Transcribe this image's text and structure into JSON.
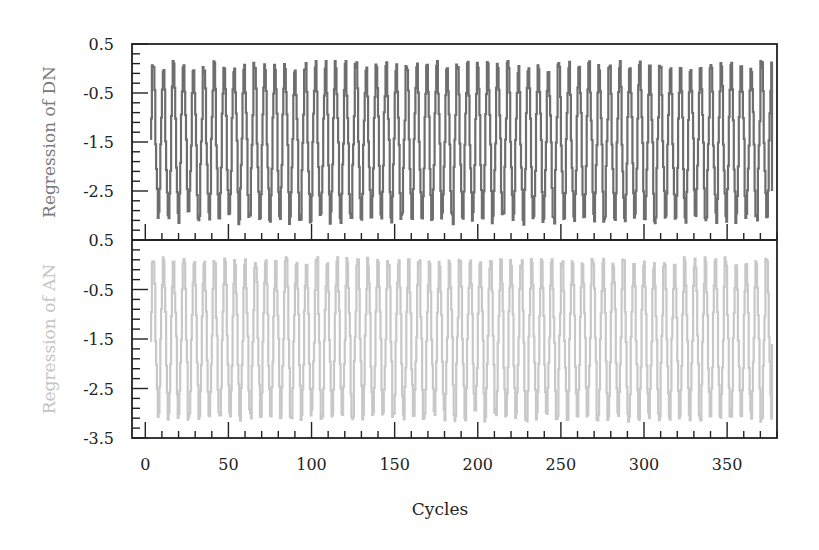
{
  "chart_data": [
    {
      "type": "line",
      "panel": "top",
      "ylabel": "Regression of DN",
      "xlabel": "",
      "color": "#6e6e6e",
      "label_color": "#7a7a7a",
      "xlim": [
        -8,
        380
      ],
      "ylim": [
        -3.5,
        0.5
      ],
      "y_ticks": [
        0.5,
        -0.5,
        -1.5,
        -2.5
      ],
      "y_tick_labels": [
        "0.5",
        "-0.5",
        "-1.5",
        "-2.5"
      ],
      "x_range_data": [
        3,
        377
      ],
      "approx_period_cycles": 6,
      "approx_peak": 0.1,
      "approx_trough": -3.1,
      "grid": false,
      "sample_points": [
        {
          "x": 3,
          "y": 0.0
        },
        {
          "x": 6,
          "y": -2.8
        },
        {
          "x": 9,
          "y": -0.3
        },
        {
          "x": 12,
          "y": -3.0
        },
        {
          "x": 15,
          "y": 0.1
        },
        {
          "x": 18,
          "y": -2.9
        },
        {
          "x": 50,
          "y": 0.0
        },
        {
          "x": 53,
          "y": -3.0
        },
        {
          "x": 100,
          "y": 0.0
        },
        {
          "x": 103,
          "y": -2.9
        },
        {
          "x": 150,
          "y": 0.05
        },
        {
          "x": 153,
          "y": -3.0
        },
        {
          "x": 200,
          "y": 0.0
        },
        {
          "x": 203,
          "y": -3.1
        },
        {
          "x": 250,
          "y": 0.0
        },
        {
          "x": 253,
          "y": -2.9
        },
        {
          "x": 300,
          "y": 0.05
        },
        {
          "x": 303,
          "y": -3.0
        },
        {
          "x": 350,
          "y": 0.0
        },
        {
          "x": 353,
          "y": -2.9
        },
        {
          "x": 377,
          "y": -2.5
        }
      ]
    },
    {
      "type": "line",
      "panel": "bottom",
      "ylabel": "Regression of AN",
      "xlabel": "Cycles",
      "color": "#c8c8c8",
      "label_color": "#c4c4c4",
      "xlim": [
        -8,
        380
      ],
      "ylim": [
        -3.5,
        0.5
      ],
      "y_ticks": [
        0.5,
        -0.5,
        -1.5,
        -2.5,
        -3.5
      ],
      "y_tick_labels": [
        "0.5",
        "-0.5",
        "-1.5",
        "-2.5",
        "-3.5"
      ],
      "x_ticks": [
        0,
        50,
        100,
        150,
        200,
        250,
        300,
        350
      ],
      "x_tick_labels": [
        "0",
        "50",
        "100",
        "150",
        "200",
        "250",
        "300",
        "350"
      ],
      "x_range_data": [
        3,
        377
      ],
      "approx_period_cycles": 6,
      "approx_peak": 0.1,
      "approx_trough": -3.1,
      "grid": false,
      "sample_points": [
        {
          "x": 3,
          "y": 0.0
        },
        {
          "x": 6,
          "y": -2.9
        },
        {
          "x": 9,
          "y": -0.2
        },
        {
          "x": 12,
          "y": -2.8
        },
        {
          "x": 15,
          "y": 0.0
        },
        {
          "x": 18,
          "y": -3.0
        },
        {
          "x": 50,
          "y": 0.0
        },
        {
          "x": 53,
          "y": -3.0
        },
        {
          "x": 100,
          "y": 0.0
        },
        {
          "x": 103,
          "y": -2.9
        },
        {
          "x": 150,
          "y": 0.1
        },
        {
          "x": 153,
          "y": -3.0
        },
        {
          "x": 200,
          "y": 0.0
        },
        {
          "x": 203,
          "y": -3.1
        },
        {
          "x": 250,
          "y": 0.05
        },
        {
          "x": 253,
          "y": -3.0
        },
        {
          "x": 300,
          "y": 0.1
        },
        {
          "x": 303,
          "y": -3.0
        },
        {
          "x": 350,
          "y": 0.0
        },
        {
          "x": 353,
          "y": -2.9
        },
        {
          "x": 377,
          "y": -1.6
        }
      ]
    }
  ],
  "layout": {
    "frame_left": 132,
    "frame_right": 777,
    "frame_top": 44,
    "frame_divider": 240,
    "frame_bottom": 438,
    "frame_color": "#222222",
    "tick_label_color": "#222222"
  },
  "generator": {
    "seed": 17,
    "step": 1,
    "period": 6.1
  }
}
